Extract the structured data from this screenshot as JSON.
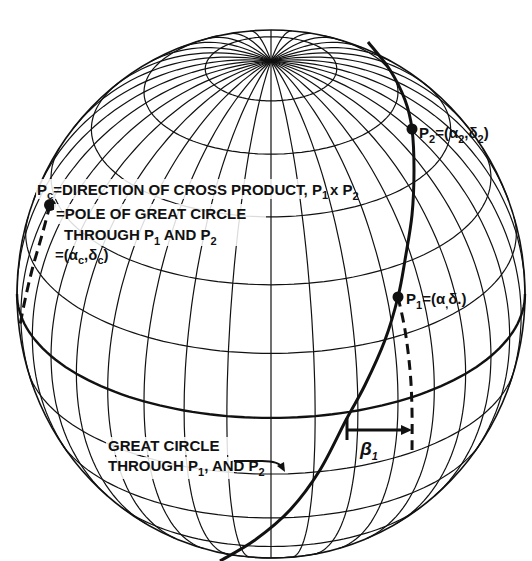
{
  "figure": {
    "type": "celestial-sphere-diagram",
    "sphere": {
      "cx": 271,
      "cy": 294,
      "rx": 254,
      "ry": 264,
      "tilt_deg": 28,
      "meridian_count": 36,
      "parallels_deg": [
        -60,
        -45,
        -30,
        -15,
        15,
        30,
        45,
        60,
        75
      ],
      "equator_deg": 0,
      "line_color": "#111111",
      "background": "#ffffff"
    },
    "points": {
      "p2": {
        "label": "P",
        "sub": "2",
        "coord_text": "=(α",
        "coord_sub1": "2",
        "coord_mid": ",δ",
        "coord_sub2": "2",
        "coord_end": ")",
        "x": 412,
        "y": 129
      },
      "p1": {
        "label": "P",
        "sub": "1",
        "coord_text": "=(α",
        "coord_sub1": ",",
        "coord_mid": "δ.",
        "coord_sub2": "",
        "coord_end": ")",
        "x": 398,
        "y": 297
      },
      "pc": {
        "x": 50,
        "y": 205
      }
    },
    "labels": {
      "pc_line1_prefix": "P",
      "pc_line1_sub": "c",
      "pc_line1_text": "=DIRECTION OF CROSS PRODUCT, P",
      "pc_line1_sub2": "1",
      "pc_line1_tail": "x P",
      "pc_line1_sub3": "2",
      "pc_line2": "=POLE OF GREAT CIRCLE",
      "pc_line3_text": "THROUGH P",
      "pc_line3_sub1": "1",
      "pc_line3_mid": " AND P",
      "pc_line3_sub2": "2",
      "pc_line4_text": "=(α",
      "pc_line4_sub1": "c",
      "pc_line4_mid": ",δ",
      "pc_line4_sub2": "c",
      "pc_line4_end": ")",
      "beta_label": "β",
      "beta_sub": "1",
      "gc_line1": "GREAT CIRCLE",
      "gc_line2_text": "THROUGH P",
      "gc_line2_sub1": "1",
      "gc_line2_mid": ", AND P",
      "gc_line2_sub2": "2"
    },
    "great_circle_path": [
      [
        368,
        42
      ],
      [
        390,
        70
      ],
      [
        405,
        100
      ],
      [
        412,
        129
      ],
      [
        414,
        170
      ],
      [
        412,
        215
      ],
      [
        405,
        260
      ],
      [
        398,
        297
      ],
      [
        385,
        340
      ],
      [
        365,
        385
      ],
      [
        346,
        420
      ],
      [
        320,
        470
      ],
      [
        290,
        510
      ],
      [
        255,
        540
      ],
      [
        220,
        561
      ]
    ],
    "pc_dashed_path": [
      [
        50,
        205
      ],
      [
        42,
        235
      ],
      [
        32,
        270
      ],
      [
        25,
        300
      ],
      [
        20,
        325
      ]
    ],
    "p1_dashed_path": [
      [
        398,
        297
      ],
      [
        405,
        330
      ],
      [
        410,
        370
      ],
      [
        412,
        410
      ],
      [
        412,
        455
      ]
    ],
    "beta_arrow": {
      "x1": 347,
      "y1": 430,
      "x2": 412,
      "y2": 430,
      "tick_top": 418,
      "tick_bottom": 440
    },
    "gc_pointer": {
      "from": [
        232,
        461
      ],
      "to": [
        285,
        472
      ]
    }
  }
}
